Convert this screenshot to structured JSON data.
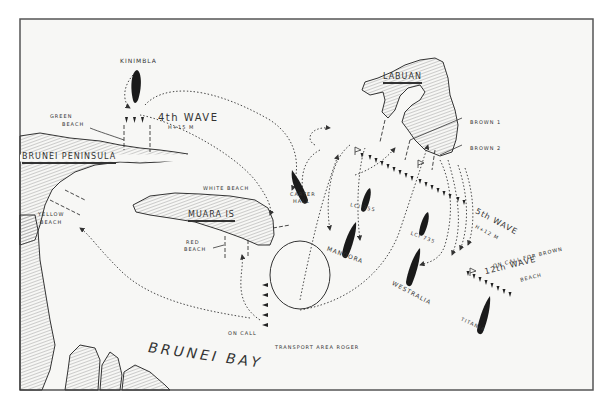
{
  "map": {
    "colors": {
      "paper": "#f7f7f5",
      "ink": "#2a2a2a",
      "land_hatch": "#8a8a8a",
      "border": "#555555"
    },
    "places": {
      "labuan": "LABUAN",
      "brunei_peninsula": "BRUNEI PENINSULA",
      "muara": "MUARA IS",
      "brunei_bay": "BRUNEI BAY"
    },
    "beaches": {
      "green": [
        "GREEN",
        "BEACH"
      ],
      "white": "WHITE BEACH",
      "yellow": [
        "YELLOW",
        "BEACH"
      ],
      "red": [
        "RED",
        "BEACH"
      ],
      "brown1": "BROWN 1",
      "brown2": "BROWN 2"
    },
    "ships": {
      "kinimbla": "KINIMBLA",
      "carter_hall": [
        "CARTER",
        "HALL"
      ],
      "lci_355": "LCI 355",
      "lci_735": "LCI 735",
      "manoora": "MANOORA",
      "westralia": "WESTRALIA",
      "titania": "TITANIA"
    },
    "waves": {
      "w4": {
        "title": "4th WAVE",
        "time": "H+15 M"
      },
      "w5": {
        "title": "5th WAVE",
        "time": "H+12 M"
      },
      "w12": {
        "title": "12th WAVE",
        "note": "ON CALL FOR BROWN",
        "note2": "BEACH"
      }
    },
    "misc": {
      "on_call": "ON CALL",
      "transport_area": "TRANSPORT AREA ROGER"
    }
  }
}
